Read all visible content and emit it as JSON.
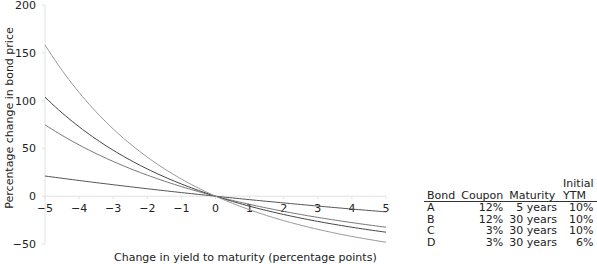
{
  "chart_data": {
    "type": "line",
    "title": "",
    "xlabel": "Change in yield to maturity (percentage points)",
    "ylabel": "Percentage change in bond price",
    "xlim": [
      -5,
      5
    ],
    "ylim": [
      -50,
      200
    ],
    "x_ticks": [
      "−5",
      "−4",
      "−3",
      "−2",
      "−1",
      "0",
      "1",
      "2",
      "3",
      "4",
      "5"
    ],
    "y_ticks": [
      "200",
      "150",
      "100",
      "50",
      "0",
      "−50"
    ],
    "grid": false,
    "legend_position": "table, lower right",
    "x": [
      -5,
      -4,
      -3,
      -2,
      -1,
      0,
      1,
      2,
      3,
      4,
      5
    ],
    "series": [
      {
        "name": "A",
        "coupon": "12%",
        "maturity": "5 years",
        "ytm": "10%",
        "values": [
          28.0,
          21.9,
          16.0,
          10.4,
          5.1,
          0.0,
          -4.8,
          -9.5,
          -13.8,
          -18.0,
          -21.9
        ],
        "color": "#555555"
      },
      {
        "name": "B",
        "coupon": "12%",
        "maturity": "30 years",
        "ytm": "10%",
        "values": [
          103.0,
          73.1,
          49.2,
          30.1,
          14.0,
          0.0,
          -11.5,
          -21.6,
          -29.5,
          -36.0,
          -41.2
        ],
        "color": "#777777"
      },
      {
        "name": "C",
        "coupon": "3%",
        "maturity": "30 years",
        "ytm": "10%",
        "values": [
          158.0,
          105.0,
          66.9,
          39.5,
          17.8,
          0.0,
          -13.7,
          -24.3,
          -32.5,
          -39.0,
          -44.5
        ],
        "color": "#444444"
      },
      {
        "name": "D",
        "coupon": "3%",
        "maturity": "30 years",
        "ytm": "6%",
        "values": [
          75.0,
          55.0,
          38.0,
          23.0,
          10.5,
          0.0,
          -9.0,
          -16.8,
          -23.5,
          -29.0,
          -33.7
        ],
        "color": "#999999"
      }
    ]
  },
  "legend": {
    "headers": [
      "Bond",
      "Coupon",
      "Maturity",
      "Initial YTM"
    ],
    "header_top": "Initial",
    "header_bottom": "YTM",
    "rows": [
      {
        "bond": "A",
        "coupon": "12%",
        "maturity": "5 years",
        "ytm": "10%"
      },
      {
        "bond": "B",
        "coupon": "12%",
        "maturity": "30 years",
        "ytm": "10%"
      },
      {
        "bond": "C",
        "coupon": "3%",
        "maturity": "30 years",
        "ytm": "10%"
      },
      {
        "bond": "D",
        "coupon": "3%",
        "maturity": "30 years",
        "ytm": "6%"
      }
    ]
  }
}
